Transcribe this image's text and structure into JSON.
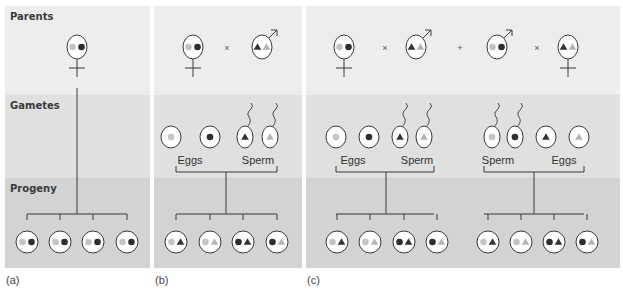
{
  "bands": {
    "parents": {
      "label": "Parents",
      "y": 6,
      "h": 89,
      "color": "#ededed"
    },
    "gametes": {
      "label": "Gametes",
      "y": 95,
      "h": 83,
      "color": "#e0e0e0"
    },
    "progeny": {
      "label": "Progeny",
      "y": 178,
      "h": 90,
      "color": "#d3d3d3"
    }
  },
  "colors": {
    "light_allele": "#c4c4c4",
    "dark_allele": "#2e2e2e",
    "dark_triangle": "#333333",
    "light_triangle": "#b4b4b4",
    "cell_fill": "#ffffff",
    "stroke": "#3a3a3a"
  },
  "panels": [
    {
      "id": "a",
      "label": "(a)",
      "x": 5,
      "w": 145,
      "parents": [
        {
          "sex": "female",
          "cx": 77,
          "alleles": [
            "light-circle",
            "dark-circle"
          ]
        }
      ],
      "operators": [],
      "gametes": [],
      "gamete_labels": [],
      "families": [
        {
          "stem_x": 77,
          "stem_top": 88,
          "bar_y": 214,
          "bar_x1": 27,
          "bar_x2": 127,
          "progeny": [
            {
              "cx": 27,
              "alleles": [
                "light-circle",
                "dark-circle"
              ]
            },
            {
              "cx": 60,
              "alleles": [
                "light-circle",
                "dark-circle"
              ]
            },
            {
              "cx": 93,
              "alleles": [
                "light-circle",
                "dark-circle"
              ]
            },
            {
              "cx": 127,
              "alleles": [
                "light-circle",
                "dark-circle"
              ]
            }
          ]
        }
      ]
    },
    {
      "id": "b",
      "label": "(b)",
      "x": 154,
      "w": 148,
      "parents": [
        {
          "sex": "female",
          "cx": 193,
          "alleles": [
            "light-circle",
            "dark-circle"
          ]
        },
        {
          "sex": "male",
          "cx": 262,
          "alleles": [
            "dark-triangle",
            "light-triangle"
          ]
        }
      ],
      "operators": [
        {
          "symbol": "×",
          "x": 227
        }
      ],
      "gametes": [
        {
          "type": "egg",
          "cx": 171,
          "allele": "light-circle"
        },
        {
          "type": "egg",
          "cx": 210,
          "allele": "dark-circle"
        },
        {
          "type": "sperm",
          "cx": 245,
          "allele": "dark-triangle"
        },
        {
          "type": "sperm",
          "cx": 270,
          "allele": "light-triangle"
        }
      ],
      "gamete_labels": [
        {
          "text": "Eggs",
          "x": 190
        },
        {
          "text": "Sperm",
          "x": 258
        }
      ],
      "families": [
        {
          "top_bar_y": 172,
          "top_x1": 176,
          "top_x2": 277,
          "stem_x": 226,
          "bar_y": 214,
          "bar_x1": 176,
          "bar_x2": 277,
          "progeny": [
            {
              "cx": 176,
              "alleles": [
                "light-circle",
                "dark-triangle"
              ]
            },
            {
              "cx": 210,
              "alleles": [
                "light-circle",
                "light-triangle"
              ]
            },
            {
              "cx": 243,
              "alleles": [
                "dark-circle",
                "dark-triangle"
              ]
            },
            {
              "cx": 277,
              "alleles": [
                "dark-circle",
                "light-triangle"
              ]
            }
          ]
        }
      ]
    },
    {
      "id": "c",
      "label": "(c)",
      "x": 306,
      "w": 314,
      "parents": [
        {
          "sex": "female",
          "cx": 344,
          "alleles": [
            "light-circle",
            "dark-circle"
          ]
        },
        {
          "sex": "male",
          "cx": 416,
          "alleles": [
            "dark-triangle",
            "light-triangle"
          ]
        },
        {
          "sex": "male",
          "cx": 497,
          "alleles": [
            "light-circle",
            "dark-circle"
          ]
        },
        {
          "sex": "female",
          "cx": 568,
          "alleles": [
            "dark-triangle",
            "light-triangle"
          ]
        }
      ],
      "operators": [
        {
          "symbol": "×",
          "x": 385
        },
        {
          "symbol": "+",
          "x": 460
        },
        {
          "symbol": "×",
          "x": 537
        }
      ],
      "gametes": [
        {
          "type": "egg",
          "cx": 336,
          "allele": "light-circle"
        },
        {
          "type": "egg",
          "cx": 369,
          "allele": "dark-circle"
        },
        {
          "type": "sperm",
          "cx": 400,
          "allele": "dark-triangle"
        },
        {
          "type": "sperm",
          "cx": 424,
          "allele": "light-triangle"
        },
        {
          "type": "sperm",
          "cx": 492,
          "allele": "light-circle"
        },
        {
          "type": "sperm",
          "cx": 515,
          "allele": "dark-circle"
        },
        {
          "type": "egg",
          "cx": 546,
          "allele": "dark-triangle"
        },
        {
          "type": "egg",
          "cx": 579,
          "allele": "light-triangle"
        }
      ],
      "gamete_labels": [
        {
          "text": "Eggs",
          "x": 353
        },
        {
          "text": "Sperm",
          "x": 417
        },
        {
          "text": "Sperm",
          "x": 498
        },
        {
          "text": "Eggs",
          "x": 564
        }
      ],
      "families": [
        {
          "top_bar_y": 172,
          "top_x1": 336,
          "top_x2": 434,
          "stem_x": 386,
          "bar_y": 214,
          "bar_x1": 336,
          "bar_x2": 434,
          "progeny": [
            {
              "cx": 337,
              "alleles": [
                "light-circle",
                "dark-triangle"
              ]
            },
            {
              "cx": 370,
              "alleles": [
                "light-circle",
                "light-triangle"
              ]
            },
            {
              "cx": 404,
              "alleles": [
                "dark-circle",
                "dark-triangle"
              ]
            },
            {
              "cx": 437,
              "alleles": [
                "dark-circle",
                "light-triangle"
              ]
            }
          ]
        },
        {
          "top_bar_y": 172,
          "top_x1": 484,
          "top_x2": 584,
          "stem_x": 534,
          "bar_y": 214,
          "bar_x1": 484,
          "bar_x2": 584,
          "progeny": [
            {
              "cx": 488,
              "alleles": [
                "light-circle",
                "dark-triangle"
              ]
            },
            {
              "cx": 521,
              "alleles": [
                "light-circle",
                "light-triangle"
              ]
            },
            {
              "cx": 554,
              "alleles": [
                "dark-circle",
                "dark-triangle"
              ]
            },
            {
              "cx": 587,
              "alleles": [
                "dark-circle",
                "light-triangle"
              ]
            }
          ]
        }
      ]
    }
  ]
}
